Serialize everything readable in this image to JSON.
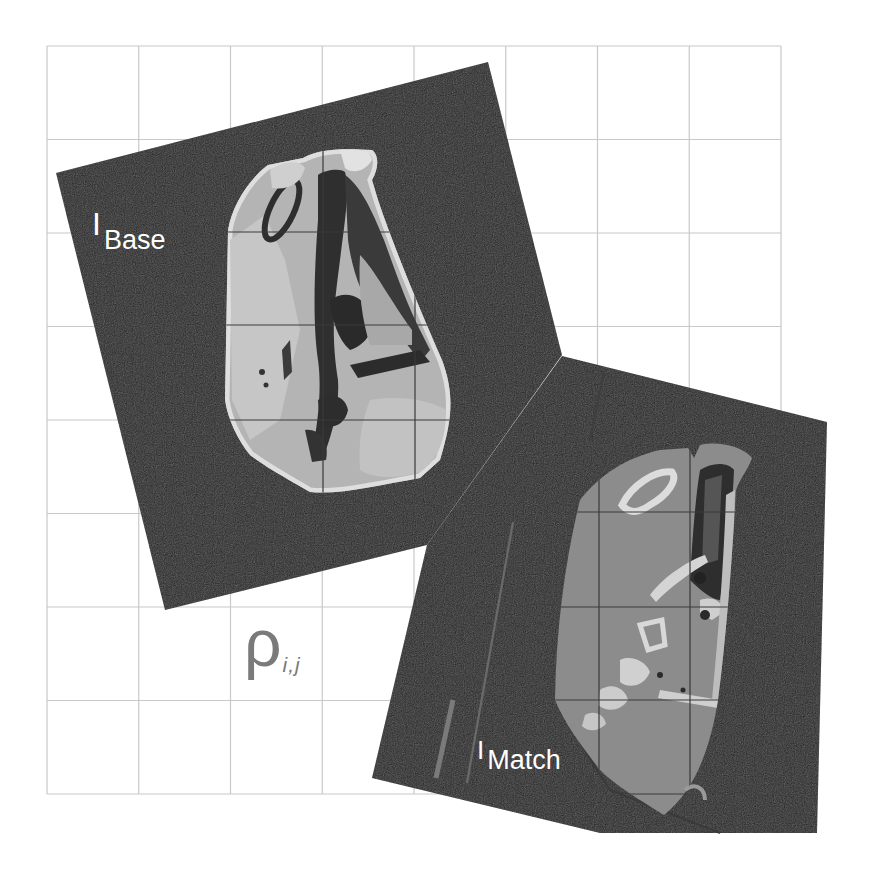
{
  "figure": {
    "background": "#ffffff",
    "grid": {
      "x0": 47,
      "y0": 46,
      "x1": 781,
      "y1": 794,
      "cols": 8,
      "rows": 8,
      "line_color": "#c8c8c8",
      "overlay_line_color": "#3a3a3a"
    },
    "panel_color": "#262626"
  },
  "base_image": {
    "label_main": "I",
    "label_sub": "Base",
    "modality": "MRI slice",
    "label_color": "#ffffff"
  },
  "match_image": {
    "label_main": "I",
    "label_sub": "Match",
    "modality": "CT slice",
    "label_color": "#ffffff"
  },
  "correlation": {
    "symbol": "ρ",
    "subscript": "i,j",
    "color": "#7a7a7a"
  }
}
